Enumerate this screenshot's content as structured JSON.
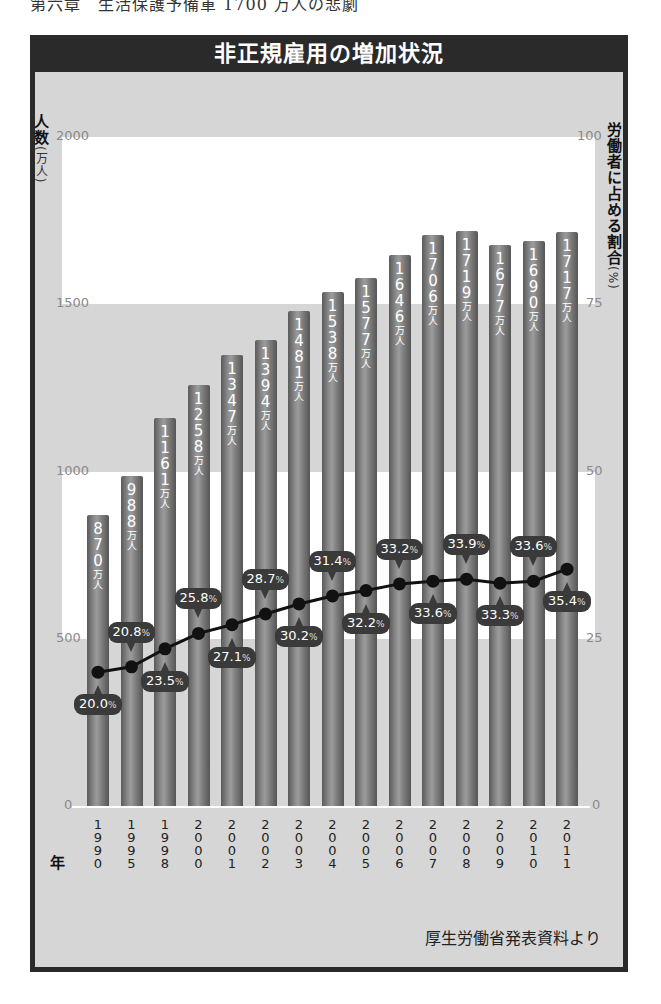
{
  "page_header": "第六章　生活保護予備軍 1700 万人の悲劇",
  "chart_data": {
    "type": "bar",
    "title": "非正規雇用の増加状況",
    "xlabel": "年",
    "ylabel": "人数（万人）",
    "y2label": "労働者に占める割合（%）",
    "ylim": [
      0,
      2000
    ],
    "y2lim": [
      0,
      100
    ],
    "yticks": [
      0,
      500,
      1000,
      1500,
      2000
    ],
    "y2ticks": [
      0,
      25,
      50,
      75,
      100
    ],
    "categories": [
      "1990",
      "1995",
      "1998",
      "2000",
      "2001",
      "2002",
      "2003",
      "2004",
      "2005",
      "2006",
      "2007",
      "2008",
      "2009",
      "2010",
      "2011"
    ],
    "series": [
      {
        "name": "非正規雇用者数（万人）",
        "type": "bar",
        "values": [
          870,
          988,
          1161,
          1258,
          1347,
          1394,
          1481,
          1538,
          1577,
          1646,
          1706,
          1719,
          1677,
          1690,
          1717
        ]
      },
      {
        "name": "労働者に占める割合（%）",
        "type": "line",
        "axis": "right",
        "values": [
          20.0,
          20.8,
          23.5,
          25.8,
          27.1,
          28.7,
          30.2,
          31.4,
          32.2,
          33.2,
          33.6,
          33.9,
          33.3,
          33.6,
          35.4
        ],
        "label_positions": [
          "below",
          "above",
          "below",
          "above",
          "below",
          "above",
          "below",
          "above",
          "below",
          "above",
          "below",
          "above",
          "below",
          "above",
          "below"
        ]
      }
    ],
    "grid": false,
    "background_bands": "alternating white/gray every 500",
    "source": "厚生労働省発表資料より"
  },
  "labels": {
    "title": "非正規雇用の増加状況",
    "left_axis_title": "人数",
    "left_axis_unit": "(万人)",
    "right_axis_title": "労働者に占める割合",
    "right_axis_unit": "(%)",
    "year_title": "年",
    "bar_unit": "万人",
    "pct_unit": "%",
    "source": "厚生労働省発表資料より",
    "left_ticks": [
      "2000",
      "1500",
      "1000",
      "500",
      "0"
    ],
    "right_ticks": [
      "100",
      "75",
      "50",
      "25",
      "0"
    ]
  }
}
